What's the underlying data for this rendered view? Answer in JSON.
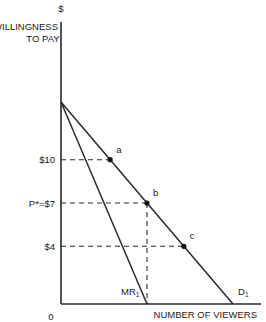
{
  "diagram": {
    "y_axis": {
      "unit_label": "$",
      "title_line1": "WILLINGNESS",
      "title_line2": "TO PAY"
    },
    "x_axis": {
      "title": "NUMBER OF VIEWERS",
      "origin_label": "0"
    },
    "price_intercept": 14,
    "quantity_max": 14,
    "curves": {
      "demand": {
        "label": "D",
        "subscript": "1",
        "equation": "P = 14 - Q"
      },
      "marginal_revenue": {
        "label": "MR",
        "subscript": "1",
        "equation": "P = 14 - 2Q"
      }
    },
    "price_levels": [
      {
        "label": "$10",
        "price": 10
      },
      {
        "label": "P*=$7",
        "price": 7
      },
      {
        "label": "$4",
        "price": 4
      }
    ],
    "points": [
      {
        "label": "a",
        "price": 10,
        "quantity": 4
      },
      {
        "label": "b",
        "price": 7,
        "quantity": 7
      },
      {
        "label": "c",
        "price": 4,
        "quantity": 10
      }
    ],
    "optimum_quantity": 7
  }
}
